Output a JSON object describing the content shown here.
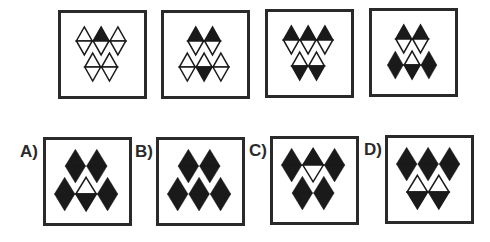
{
  "puzzle": {
    "type": "diamond-sequence",
    "colors": {
      "ink": "#1a1a1a",
      "frame": "#2a2a2a",
      "paper": "#ffffff"
    },
    "sequence": [
      {
        "id": "seq-1",
        "rows": [
          [
            "split",
            "top-black",
            "split"
          ],
          [
            "split",
            "split"
          ]
        ]
      },
      {
        "id": "seq-2",
        "rows": [
          [
            "top-black",
            "top-black"
          ],
          [
            "split",
            "bottom-black",
            "split"
          ]
        ]
      },
      {
        "id": "seq-3",
        "rows": [
          [
            "top-black",
            "top-black",
            "top-black"
          ],
          [
            "bottom-black",
            "bottom-black"
          ]
        ]
      },
      {
        "id": "seq-4",
        "rows": [
          [
            "top-black",
            "top-black"
          ],
          [
            "full-black",
            "bottom-black",
            "full-black"
          ]
        ]
      }
    ],
    "options": [
      {
        "label": "A)",
        "rows": [
          [
            "full-black",
            "full-black"
          ],
          [
            "full-black",
            "bottom-black",
            "full-black"
          ]
        ]
      },
      {
        "label": "B)",
        "rows": [
          [
            "full-black",
            "full-black"
          ],
          [
            "full-black",
            "full-black",
            "full-black"
          ]
        ]
      },
      {
        "label": "C)",
        "rows": [
          [
            "full-black",
            "top-black",
            "full-black"
          ],
          [
            "full-black",
            "full-black"
          ]
        ]
      },
      {
        "label": "D)",
        "rows": [
          [
            "full-black",
            "full-black",
            "full-black"
          ],
          [
            "bottom-black",
            "bottom-black"
          ]
        ]
      }
    ]
  }
}
